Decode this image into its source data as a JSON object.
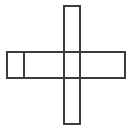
{
  "canvas": {
    "width": 134,
    "height": 130,
    "background_color": "#ffffff"
  },
  "figure": {
    "name": "cross-outline-diagram",
    "stroke_color": "#3c3c3c",
    "stroke_width": 2,
    "fill_color": "none"
  },
  "shapes": {
    "horizontal_bar": {
      "label": "horizontal-bar",
      "x": 7,
      "y": 52,
      "width": 118,
      "height": 26
    },
    "vertical_bar": {
      "label": "vertical-bar",
      "x": 64,
      "y": 6,
      "width": 16,
      "height": 118
    },
    "left_divider": {
      "label": "left-divider-line",
      "x1": 24,
      "y1": 52,
      "x2": 24,
      "y2": 78
    }
  },
  "cells": {
    "left_small_cell": {
      "label": "left-small-cell",
      "x": 7,
      "y": 52,
      "width": 17,
      "height": 26
    }
  }
}
